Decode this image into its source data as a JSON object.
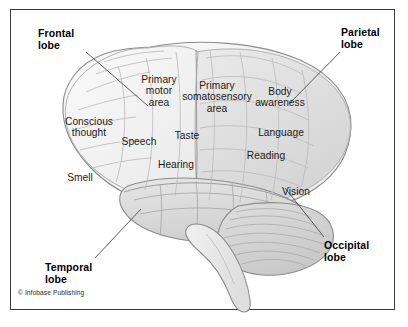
{
  "figure": {
    "credit": "© Infobase Publishing",
    "frame_color": "#3a3a3c",
    "background_color": "#ffffff"
  },
  "lobe_labels": [
    {
      "name": "frontal-lobe",
      "text": "Frontal\nlobe",
      "x": 38,
      "y": 28,
      "leader": {
        "x1": 86,
        "y1": 52,
        "x2": 148,
        "y2": 106
      }
    },
    {
      "name": "parietal-lobe",
      "text": "Parietal\nlobe",
      "x": 341,
      "y": 27,
      "leader": {
        "x1": 340,
        "y1": 52,
        "x2": 289,
        "y2": 104
      }
    },
    {
      "name": "temporal-lobe",
      "text": "Temporal\nlobe",
      "x": 45,
      "y": 262,
      "leader": {
        "x1": 95,
        "y1": 258,
        "x2": 141,
        "y2": 209
      }
    },
    {
      "name": "occipital-lobe",
      "text": "Occipital\nlobe",
      "x": 324,
      "y": 240,
      "leader": {
        "x1": 324,
        "y1": 237,
        "x2": 285,
        "y2": 188
      }
    }
  ],
  "area_labels": [
    {
      "name": "primary-motor-area",
      "text": "Primary\nmotor\narea",
      "x": 128,
      "y": 74,
      "w": 62
    },
    {
      "name": "primary-somatosensory-area",
      "text": "Primary\nsomatosensory\narea",
      "x": 175,
      "y": 80,
      "w": 84
    },
    {
      "name": "body-awareness",
      "text": "Body\nawareness",
      "x": 251,
      "y": 86,
      "w": 58
    },
    {
      "name": "conscious-thought",
      "text": "Conscious\nthought",
      "x": 58,
      "y": 116,
      "w": 62
    },
    {
      "name": "speech",
      "text": "Speech",
      "x": 118,
      "y": 136,
      "w": 42
    },
    {
      "name": "taste",
      "text": "Taste",
      "x": 170,
      "y": 130,
      "w": 34
    },
    {
      "name": "language",
      "text": "Language",
      "x": 253,
      "y": 127,
      "w": 56
    },
    {
      "name": "reading",
      "text": "Reading",
      "x": 242,
      "y": 150,
      "w": 48
    },
    {
      "name": "hearing",
      "text": "Hearing",
      "x": 153,
      "y": 159,
      "w": 46
    },
    {
      "name": "smell",
      "text": "Smell",
      "x": 62,
      "y": 172,
      "w": 36
    },
    {
      "name": "vision",
      "text": "Vision",
      "x": 277,
      "y": 186,
      "w": 38
    }
  ],
  "palette": {
    "cortex_light": "#f2f2f2",
    "cortex_mid": "#e3e3e3",
    "cortex_dark": "#d6d6d6",
    "cerebellum": "#d2d2d2",
    "brainstem": "#ececec",
    "outline": "#8c8c8c",
    "sulci": "#b4b4b4",
    "leader_line": "#4a4a4a",
    "text": "#1a1a1a"
  }
}
